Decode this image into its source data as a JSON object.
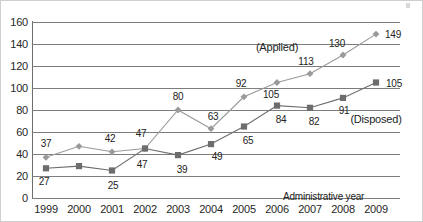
{
  "chart_data": {
    "type": "line",
    "title": "",
    "xlabel": "Administrative year",
    "ylabel": "",
    "x": [
      "1999",
      "2000",
      "2001",
      "2002",
      "2003",
      "2004",
      "2005",
      "2006",
      "2007",
      "2008",
      "2009"
    ],
    "ylim": [
      0,
      160
    ],
    "ytick_step": 20,
    "yticks": [
      "0",
      "20",
      "40",
      "60",
      "80",
      "100",
      "120",
      "140",
      "160"
    ],
    "grid": "horizontal",
    "legend_position": "inline-annotation",
    "series": [
      {
        "name": "(Applied)",
        "marker": "diamond",
        "color": "#9a9a9a",
        "values": [
          37,
          47,
          42,
          45,
          80,
          63,
          92,
          105,
          113,
          130,
          149
        ],
        "point_labels": [
          "37",
          "",
          "42",
          "47",
          "80",
          "63",
          "92",
          "105",
          "113",
          "130",
          "149"
        ]
      },
      {
        "name": "(Disposed)",
        "marker": "square",
        "color": "#6d6d6d",
        "values": [
          27,
          29,
          25,
          45,
          39,
          49,
          65,
          84,
          82,
          91,
          105
        ],
        "point_labels": [
          "27",
          "",
          "25",
          "47",
          "39",
          "49",
          "65",
          "84",
          "82",
          "91",
          "105"
        ]
      }
    ],
    "annotations": [
      {
        "text": "(Applied)",
        "x_year": "2006",
        "y_value": 137
      },
      {
        "text": "(Disposed)",
        "x_year": "2009",
        "y_value": 72
      }
    ]
  },
  "colors": {
    "applied_series": "#9a9a9a",
    "disposed_series": "#6d6d6d",
    "gridline": "#7d7d7d",
    "axis": "#6e6e6e",
    "text": "#222222",
    "background": "#ffffff"
  }
}
